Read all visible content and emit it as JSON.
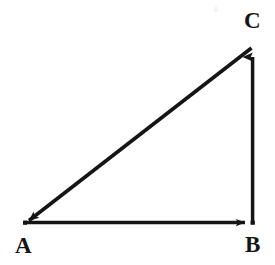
{
  "figure": {
    "background_color": "#ffffff",
    "stroke_color": "#151515",
    "stroke_width": 3.6,
    "width": 275,
    "height": 265
  },
  "vertices": [
    {
      "name": "A",
      "label": "A",
      "x": 24,
      "y": 223,
      "label_x": 15,
      "label_y": 234
    },
    {
      "name": "B",
      "label": "B",
      "x": 253,
      "y": 223,
      "label_x": 245,
      "label_y": 233
    },
    {
      "name": "C",
      "label": "C",
      "x": 253,
      "y": 46,
      "label_x": 244,
      "label_y": 9
    }
  ],
  "vectors": [
    {
      "name": "vector-AB",
      "from": "A",
      "to": "B",
      "orientation": "horizontal",
      "arrowhead_at": "B",
      "x1": 24,
      "y1": 223,
      "x2": 253,
      "y2": 223
    },
    {
      "name": "vector-BC",
      "from": "B",
      "to": "C",
      "orientation": "vertical",
      "arrowhead_at": "C",
      "x1": 253,
      "y1": 223,
      "x2": 253,
      "y2": 46
    },
    {
      "name": "vector-CA",
      "from": "C",
      "to": "A",
      "orientation": "diagonal-hypotenuse",
      "arrowhead_at": "A",
      "x1": 253,
      "y1": 46,
      "x2": 24,
      "y2": 223
    }
  ],
  "artifacts": [
    {
      "name": "scan-speck",
      "x": 214,
      "y": 7
    }
  ]
}
